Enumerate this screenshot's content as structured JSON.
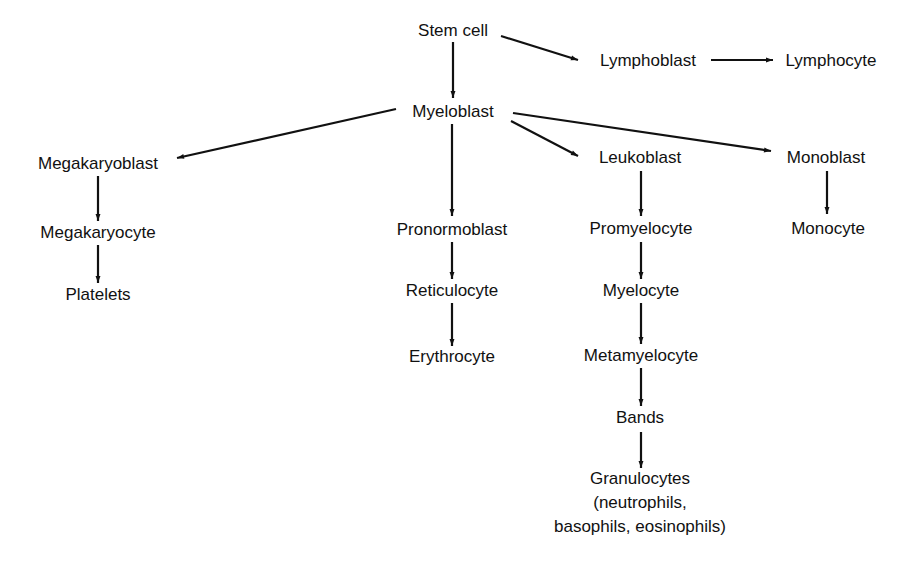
{
  "diagram": {
    "type": "hematopoiesis-flowchart",
    "nodes": {
      "stem_cell": {
        "label": "Stem cell",
        "x": 453,
        "y": 30
      },
      "lymphoblast": {
        "label": "Lymphoblast",
        "x": 648,
        "y": 60
      },
      "lymphocyte": {
        "label": "Lymphocyte",
        "x": 831,
        "y": 60
      },
      "myeloblast": {
        "label": "Myeloblast",
        "x": 453,
        "y": 111
      },
      "megakaryoblast": {
        "label": "Megakaryoblast",
        "x": 98,
        "y": 163
      },
      "megakaryocyte": {
        "label": "Megakaryocyte",
        "x": 98,
        "y": 232
      },
      "platelets": {
        "label": "Platelets",
        "x": 98,
        "y": 294
      },
      "pronormoblast": {
        "label": "Pronormoblast",
        "x": 452,
        "y": 229
      },
      "reticulocyte": {
        "label": "Reticulocyte",
        "x": 452,
        "y": 290
      },
      "erythrocyte": {
        "label": "Erythrocyte",
        "x": 452,
        "y": 356
      },
      "leukoblast": {
        "label": "Leukoblast",
        "x": 640,
        "y": 157
      },
      "promyelocyte": {
        "label": "Promyelocyte",
        "x": 641,
        "y": 228
      },
      "myelocyte": {
        "label": "Myelocyte",
        "x": 641,
        "y": 290
      },
      "metamyelocyte": {
        "label": "Metamyelocyte",
        "x": 641,
        "y": 355
      },
      "bands": {
        "label": "Bands",
        "x": 640,
        "y": 417
      },
      "granulocytes": {
        "label": "Granulocytes",
        "line2": "(neutrophils,",
        "line3": "basophils, eosinophils)",
        "x": 640,
        "y": 503
      },
      "monoblast": {
        "label": "Monoblast",
        "x": 826,
        "y": 157
      },
      "monocyte": {
        "label": "Monocyte",
        "x": 828,
        "y": 228
      }
    },
    "edges": [
      {
        "from": "stem_cell",
        "to": "myeloblast"
      },
      {
        "from": "stem_cell",
        "to": "lymphoblast"
      },
      {
        "from": "lymphoblast",
        "to": "lymphocyte"
      },
      {
        "from": "myeloblast",
        "to": "megakaryoblast"
      },
      {
        "from": "myeloblast",
        "to": "pronormoblast"
      },
      {
        "from": "myeloblast",
        "to": "leukoblast"
      },
      {
        "from": "myeloblast",
        "to": "monoblast"
      },
      {
        "from": "megakaryoblast",
        "to": "megakaryocyte"
      },
      {
        "from": "megakaryocyte",
        "to": "platelets"
      },
      {
        "from": "pronormoblast",
        "to": "reticulocyte"
      },
      {
        "from": "reticulocyte",
        "to": "erythrocyte"
      },
      {
        "from": "leukoblast",
        "to": "promyelocyte"
      },
      {
        "from": "promyelocyte",
        "to": "myelocyte"
      },
      {
        "from": "myelocyte",
        "to": "metamyelocyte"
      },
      {
        "from": "metamyelocyte",
        "to": "bands"
      },
      {
        "from": "bands",
        "to": "granulocytes"
      },
      {
        "from": "monoblast",
        "to": "monocyte"
      }
    ],
    "colors": {
      "ink": "#111111",
      "background": "#ffffff"
    }
  }
}
